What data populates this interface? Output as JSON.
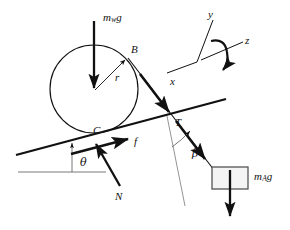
{
  "figure": {
    "type": "physics-free-body-diagram",
    "background_color": "#ffffff",
    "line_color": "#111111",
    "block_fill": "#f4f4f4"
  },
  "labels": {
    "weight_wheel": {
      "base": "m",
      "sub": "w",
      "tail": "g",
      "text": "m_w g"
    },
    "radius": {
      "text": "r"
    },
    "point_b": {
      "text": "B"
    },
    "point_c": {
      "text": "C"
    },
    "friction": {
      "text": "f"
    },
    "normal": {
      "text": "N"
    },
    "tension": {
      "text": "T"
    },
    "incline_angle": {
      "text": "θ"
    },
    "cable_angle": {
      "text": "β"
    },
    "axis_x": {
      "text": "x"
    },
    "axis_y": {
      "text": "y"
    },
    "axis_z": {
      "text": "z"
    },
    "weight_block": {
      "base": "m",
      "sub": "A",
      "tail": "g",
      "text": "m_A g"
    }
  },
  "geometry": {
    "wheel": {
      "cx": 94,
      "cy": 89,
      "r": 44
    },
    "incline": {
      "x1": 16,
      "y1": 155,
      "x2": 226,
      "y2": 99
    },
    "ground": {
      "x1": 18,
      "y1": 172,
      "x2": 106,
      "y2": 172
    },
    "point_b": {
      "x": 128,
      "y": 57
    },
    "point_c": {
      "x": 97,
      "y": 133
    },
    "block": {
      "x": 212,
      "y": 167,
      "w": 36,
      "h": 22
    }
  }
}
